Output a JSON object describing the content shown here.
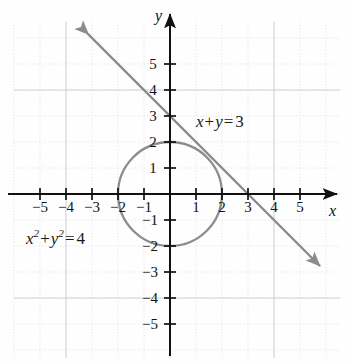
{
  "chart_data": {
    "type": "line",
    "title": "",
    "xlabel": "x",
    "ylabel": "y",
    "xlim": [
      -6.2,
      6.5
    ],
    "ylim": [
      -6.2,
      6.3
    ],
    "grid": true,
    "legend": "none",
    "x_ticks": [
      -5,
      -4,
      -3,
      -2,
      -1,
      1,
      2,
      3,
      4,
      5
    ],
    "y_ticks": [
      5,
      4,
      3,
      2,
      1,
      -1,
      -2,
      -3,
      -4,
      -5
    ],
    "x_tick_labels": [
      "-5",
      "-4",
      "-3",
      "-2",
      "-1",
      "1",
      "2",
      "3",
      "4",
      "5"
    ],
    "y_tick_labels": [
      "5",
      "4",
      "3",
      "2",
      "1",
      "-1",
      "-2",
      "-3",
      "-4",
      "-5"
    ],
    "series": [
      {
        "name": "x + y = 3",
        "kind": "line",
        "equation": "x + y = 3",
        "slope": -1,
        "intercept": 3,
        "color": "#8c8c8c",
        "arrows": "both",
        "x_from": -3.15,
        "x_to": 5.75,
        "points": [
          [
            -3.15,
            6.15
          ],
          [
            0,
            3
          ],
          [
            3,
            0
          ],
          [
            5.75,
            -2.75
          ]
        ]
      },
      {
        "name": "x^2 + y^2 = 4",
        "kind": "circle",
        "equation": "x² + y² = 4",
        "center": [
          0,
          0
        ],
        "radius": 2,
        "color": "#8c8c8c"
      }
    ],
    "annotations": [
      {
        "text": "x + y = 3",
        "x": 1.0,
        "y": 2.9
      },
      {
        "text": "x² + y² = 4",
        "x": -5.5,
        "y": -1.55
      }
    ],
    "intersections": [
      [
        0,
        0
      ]
    ],
    "axis_color": "#111111",
    "grid_color": "#d9d9e0",
    "background": "#fefefe"
  },
  "labels": {
    "axis_x": "x",
    "axis_y": "y",
    "line_equation": {
      "lhs_var1": "x",
      "plus": "+",
      "lhs_var2": "y",
      "equals": "=",
      "rhs": "3"
    },
    "circle_equation": {
      "var1": "x",
      "exp1": "2",
      "plus": "+",
      "var2": "y",
      "exp2": "2",
      "equals": "=",
      "rhs": "4"
    }
  },
  "ticks": {
    "x": [
      {
        "value": -5,
        "label": "−5",
        "px": 40
      },
      {
        "value": -4,
        "label": "−4",
        "px": 66
      },
      {
        "value": -3,
        "label": "−3",
        "px": 92
      },
      {
        "value": -2,
        "label": "−2",
        "px": 118
      },
      {
        "value": -1,
        "label": "−1",
        "px": 144
      },
      {
        "value": 1,
        "label": "1",
        "px": 196
      },
      {
        "value": 2,
        "label": "2",
        "px": 222
      },
      {
        "value": 3,
        "label": "3",
        "px": 248
      },
      {
        "value": 4,
        "label": "4",
        "px": 274
      },
      {
        "value": 5,
        "label": "5",
        "px": 300
      }
    ],
    "y": [
      {
        "value": 5,
        "label": "5",
        "px": 64
      },
      {
        "value": 4,
        "label": "4",
        "px": 90
      },
      {
        "value": 3,
        "label": "3",
        "px": 116
      },
      {
        "value": 2,
        "label": "2",
        "px": 142
      },
      {
        "value": 1,
        "label": "1",
        "px": 168
      },
      {
        "value": -1,
        "label": "−1",
        "px": 220
      },
      {
        "value": -2,
        "label": "−2",
        "px": 246
      },
      {
        "value": -3,
        "label": "−3",
        "px": 272
      },
      {
        "value": -4,
        "label": "−4",
        "px": 298
      },
      {
        "value": -5,
        "label": "−5",
        "px": 324
      }
    ]
  }
}
